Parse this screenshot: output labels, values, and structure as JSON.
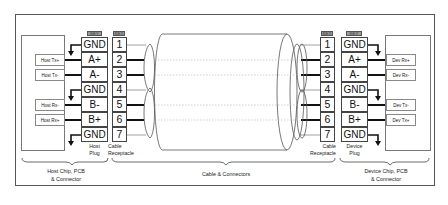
{
  "diagram": {
    "host": {
      "signals": [
        "Host Tx+",
        "Host Tx-",
        "Host Rx-",
        "Host Rx+"
      ],
      "plug_caption": [
        "Host",
        "Plug"
      ],
      "section_caption": [
        "Host Chip, PCB",
        "& Connector"
      ]
    },
    "device": {
      "signals": [
        "Dev Rx+",
        "Dev Rx-",
        "Dev Tx-",
        "Dev Tx+"
      ],
      "plug_caption": [
        "Device",
        "Plug"
      ],
      "section_caption": [
        "Device Chip, PCB",
        "& Connector"
      ]
    },
    "key_label": "KEY",
    "plug_pins": [
      "GND",
      "A+",
      "A-",
      "GND",
      "B-",
      "B+",
      "GND"
    ],
    "receptacle_pins": [
      "1",
      "2",
      "3",
      "4",
      "5",
      "6",
      "7"
    ],
    "receptacle_caption": [
      "Cable",
      "Receptacle"
    ],
    "cable_caption": "Cable & Connectors",
    "colors": {
      "line": "#444444",
      "signal_wire": "#111111",
      "key_fill": "#999999"
    }
  }
}
